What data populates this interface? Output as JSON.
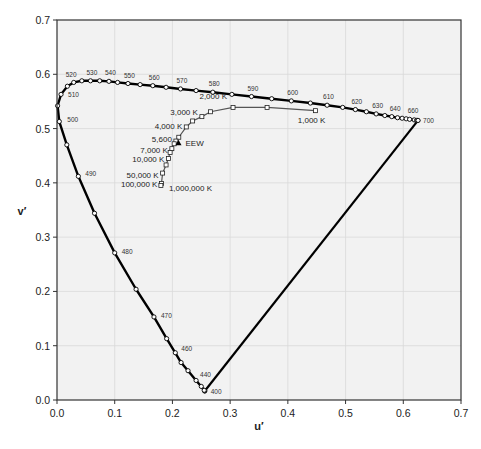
{
  "chart_data": {
    "type": "line",
    "title": "",
    "xlabel": "u′",
    "ylabel": "v′",
    "xlim": [
      0.0,
      0.7
    ],
    "ylim": [
      0.0,
      0.7
    ],
    "x_ticks": [
      "0.0",
      "0.1",
      "0.2",
      "0.3",
      "0.4",
      "0.5",
      "0.6",
      "0.7"
    ],
    "y_ticks": [
      "0.0",
      "0.1",
      "0.2",
      "0.3",
      "0.4",
      "0.5",
      "0.6",
      "0.7"
    ],
    "grid": true,
    "legend": null,
    "series": [
      {
        "name": "Spectral locus",
        "style": "thick black line with open circle markers",
        "points": [
          {
            "nm": 400,
            "u": 0.256,
            "v": 0.0165
          },
          {
            "nm": 410,
            "u": 0.256,
            "v": 0.017
          },
          {
            "nm": 420,
            "u": 0.255,
            "v": 0.018
          },
          {
            "nm": 430,
            "u": 0.25,
            "v": 0.025
          },
          {
            "nm": 440,
            "u": 0.241,
            "v": 0.036
          },
          {
            "nm": 450,
            "u": 0.227,
            "v": 0.054
          },
          {
            "nm": 455,
            "u": 0.215,
            "v": 0.069
          },
          {
            "nm": 460,
            "u": 0.205,
            "v": 0.087
          },
          {
            "nm": 465,
            "u": 0.19,
            "v": 0.113
          },
          {
            "nm": 470,
            "u": 0.168,
            "v": 0.153
          },
          {
            "nm": 475,
            "u": 0.137,
            "v": 0.204
          },
          {
            "nm": 480,
            "u": 0.1,
            "v": 0.271
          },
          {
            "nm": 485,
            "u": 0.065,
            "v": 0.344
          },
          {
            "nm": 490,
            "u": 0.037,
            "v": 0.412
          },
          {
            "nm": 495,
            "u": 0.017,
            "v": 0.47
          },
          {
            "nm": 500,
            "u": 0.004,
            "v": 0.513
          },
          {
            "nm": 505,
            "u": 0.001,
            "v": 0.542
          },
          {
            "nm": 510,
            "u": 0.007,
            "v": 0.563
          },
          {
            "nm": 515,
            "u": 0.018,
            "v": 0.578
          },
          {
            "nm": 520,
            "u": 0.029,
            "v": 0.585
          },
          {
            "nm": 525,
            "u": 0.043,
            "v": 0.588
          },
          {
            "nm": 530,
            "u": 0.058,
            "v": 0.588
          },
          {
            "nm": 535,
            "u": 0.074,
            "v": 0.588
          },
          {
            "nm": 540,
            "u": 0.09,
            "v": 0.587
          },
          {
            "nm": 545,
            "u": 0.105,
            "v": 0.585
          },
          {
            "nm": 550,
            "u": 0.123,
            "v": 0.583
          },
          {
            "nm": 555,
            "u": 0.144,
            "v": 0.581
          },
          {
            "nm": 560,
            "u": 0.166,
            "v": 0.579
          },
          {
            "nm": 565,
            "u": 0.189,
            "v": 0.576
          },
          {
            "nm": 570,
            "u": 0.214,
            "v": 0.573
          },
          {
            "nm": 575,
            "u": 0.241,
            "v": 0.57
          },
          {
            "nm": 580,
            "u": 0.27,
            "v": 0.567
          },
          {
            "nm": 585,
            "u": 0.303,
            "v": 0.563
          },
          {
            "nm": 590,
            "u": 0.337,
            "v": 0.559
          },
          {
            "nm": 595,
            "u": 0.372,
            "v": 0.555
          },
          {
            "nm": 600,
            "u": 0.406,
            "v": 0.551
          },
          {
            "nm": 605,
            "u": 0.439,
            "v": 0.547
          },
          {
            "nm": 610,
            "u": 0.468,
            "v": 0.543
          },
          {
            "nm": 615,
            "u": 0.495,
            "v": 0.539
          },
          {
            "nm": 620,
            "u": 0.517,
            "v": 0.535
          },
          {
            "nm": 625,
            "u": 0.536,
            "v": 0.531
          },
          {
            "nm": 630,
            "u": 0.553,
            "v": 0.527
          },
          {
            "nm": 635,
            "u": 0.568,
            "v": 0.524
          },
          {
            "nm": 640,
            "u": 0.58,
            "v": 0.522
          },
          {
            "nm": 645,
            "u": 0.59,
            "v": 0.52
          },
          {
            "nm": 650,
            "u": 0.598,
            "v": 0.519
          },
          {
            "nm": 655,
            "u": 0.605,
            "v": 0.518
          },
          {
            "nm": 660,
            "u": 0.611,
            "v": 0.517
          },
          {
            "nm": 670,
            "u": 0.619,
            "v": 0.516
          },
          {
            "nm": 680,
            "u": 0.623,
            "v": 0.515
          },
          {
            "nm": 690,
            "u": 0.625,
            "v": 0.515
          },
          {
            "nm": 700,
            "u": 0.6256,
            "v": 0.515
          }
        ],
        "labels": [
          400,
          440,
          460,
          470,
          480,
          490,
          500,
          510,
          520,
          530,
          540,
          550,
          560,
          570,
          580,
          590,
          600,
          610,
          620,
          630,
          640,
          660,
          700
        ]
      },
      {
        "name": "Line of purples",
        "style": "thick black line",
        "points": [
          {
            "u": 0.6256,
            "v": 0.515
          },
          {
            "u": 0.256,
            "v": 0.0165
          }
        ]
      },
      {
        "name": "Planckian locus",
        "style": "thin gray line with open square markers",
        "points": [
          {
            "label": "1,000 K",
            "u": 0.448,
            "v": 0.533
          },
          {
            "label": "1,500 K",
            "u": 0.364,
            "v": 0.539
          },
          {
            "label": "2,000 K",
            "u": 0.305,
            "v": 0.539
          },
          {
            "label": "2,500 K",
            "u": 0.266,
            "v": 0.531
          },
          {
            "label": "3,000 K",
            "u": 0.251,
            "v": 0.522
          },
          {
            "label": "3,500 K",
            "u": 0.235,
            "v": 0.514
          },
          {
            "label": "4,000 K",
            "u": 0.224,
            "v": 0.503
          },
          {
            "label": "5,000 K",
            "u": 0.211,
            "v": 0.484
          },
          {
            "label": "5,600 K",
            "u": 0.206,
            "v": 0.477
          },
          {
            "label": "6,000 K",
            "u": 0.203,
            "v": 0.472
          },
          {
            "label": "7,000 K",
            "u": 0.199,
            "v": 0.463
          },
          {
            "label": "8,000 K",
            "u": 0.196,
            "v": 0.456
          },
          {
            "label": "10,000 K",
            "u": 0.193,
            "v": 0.445
          },
          {
            "label": "15,000 K",
            "u": 0.189,
            "v": 0.433
          },
          {
            "label": "50,000 K",
            "u": 0.183,
            "v": 0.418
          },
          {
            "label": "100,000 K",
            "u": 0.181,
            "v": 0.399
          },
          {
            "label": "1,000,000 K",
            "u": 0.18,
            "v": 0.395
          }
        ],
        "labels": [
          "1,000 K",
          "2,000 K",
          "3,000 K",
          "4,000 K",
          "5,600",
          "7,000 K",
          "10,000 K",
          "50,000 K",
          "100,000 K",
          "1,000,000 K"
        ]
      },
      {
        "name": "EEW",
        "style": "filled triangle marker",
        "points": [
          {
            "label": "EEW",
            "u": 0.2105,
            "v": 0.4737
          }
        ]
      }
    ]
  },
  "colors": {
    "plot_background": "#f2f2f2",
    "grid": "#d9d9d9",
    "spectral_locus": "#000000",
    "planckian_locus": "#555555"
  }
}
